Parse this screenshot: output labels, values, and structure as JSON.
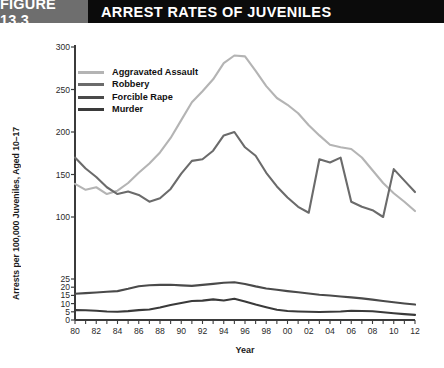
{
  "header": {
    "figure_tag": "FIGURE 13.3",
    "title": "ARREST RATES OF JUVENILES",
    "tag_bg": "#6e6e6e",
    "bar_bg": "#0b0b0b"
  },
  "chart_data": {
    "type": "line",
    "title": "ARREST RATES OF JUVENILES",
    "xlabel": "Year",
    "ylabel": "Arrests per 100,000 Juveniles, Aged 10–17",
    "grid": false,
    "legend_position": "upper-left-inside",
    "broken_axis": true,
    "ylim_lower": [
      0,
      25
    ],
    "ylim_upper": [
      100,
      300
    ],
    "yticks_lower": [
      "0",
      "5",
      "10",
      "15",
      "20",
      "25"
    ],
    "yticks_upper": [
      "100",
      "150",
      "200",
      "250",
      "300"
    ],
    "x": [
      1980,
      1981,
      1982,
      1983,
      1984,
      1985,
      1986,
      1987,
      1988,
      1989,
      1990,
      1991,
      1992,
      1993,
      1994,
      1995,
      1996,
      1997,
      1998,
      1999,
      2000,
      2001,
      2002,
      2003,
      2004,
      2005,
      2006,
      2007,
      2008,
      2009,
      2010,
      2011,
      2012
    ],
    "xticks": [
      "80",
      "82",
      "84",
      "86",
      "88",
      "90",
      "92",
      "94",
      "96",
      "98",
      "00",
      "02",
      "04",
      "06",
      "08",
      "10",
      "12"
    ],
    "xtick_years": [
      1980,
      1982,
      1984,
      1986,
      1988,
      1990,
      1992,
      1994,
      1996,
      1998,
      2000,
      2002,
      2004,
      2006,
      2008,
      2010,
      2012
    ],
    "series": [
      {
        "name": "Aggravated Assault",
        "color": "#b4b4b4",
        "values": [
          139,
          132,
          135,
          127,
          131,
          140,
          152,
          163,
          176,
          193,
          214,
          235,
          248,
          262,
          281,
          290,
          289,
          272,
          254,
          240,
          232,
          222,
          208,
          196,
          185,
          182,
          180,
          170,
          155,
          140,
          128,
          118,
          107
        ]
      },
      {
        "name": "Robbery",
        "color": "#6b6b6b",
        "values": [
          170,
          157,
          147,
          135,
          127,
          130,
          126,
          118,
          122,
          133,
          151,
          166,
          168,
          178,
          196,
          200,
          182,
          172,
          152,
          136,
          123,
          112,
          105,
          98,
          96,
          99,
          118,
          112,
          108,
          100,
          92,
          85,
          78
        ]
      },
      {
        "name": "Forcible Rape",
        "color": "#4a4a4a",
        "values": [
          16.0,
          16.4,
          16.8,
          17.2,
          17.6,
          19.0,
          20.6,
          21.2,
          21.4,
          21.5,
          21.1,
          20.8,
          21.4,
          22.0,
          22.7,
          23.0,
          22.0,
          20.5,
          19.2,
          18.4,
          17.6,
          16.9,
          16.2,
          15.4,
          14.9,
          14.3,
          13.8,
          13.2,
          12.4,
          11.6,
          10.8,
          10.1,
          9.4
        ]
      },
      {
        "name": "Murder",
        "color": "#3a3a3a",
        "values": [
          6.0,
          5.9,
          5.6,
          5.2,
          5.0,
          5.4,
          6.0,
          6.4,
          7.6,
          9.2,
          10.4,
          11.6,
          11.8,
          12.6,
          11.9,
          13.0,
          11.3,
          9.4,
          7.8,
          6.3,
          5.5,
          5.2,
          5.0,
          4.9,
          5.0,
          5.2,
          5.6,
          5.5,
          5.3,
          4.7,
          4.1,
          3.6,
          3.1
        ]
      }
    ]
  }
}
